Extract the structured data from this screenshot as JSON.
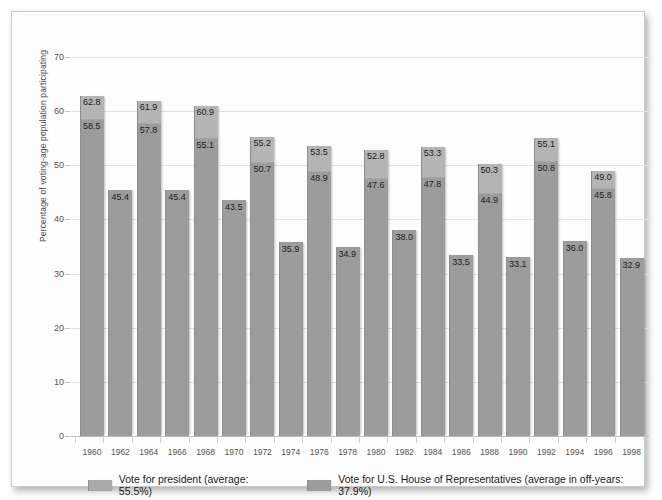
{
  "chart_data": {
    "type": "bar",
    "title": "",
    "xlabel": "",
    "ylabel": "Percentage of voting-age population participating",
    "ylim": [
      0,
      70
    ],
    "yticks": [
      0,
      10,
      20,
      30,
      40,
      50,
      60,
      70
    ],
    "grid": true,
    "legend_position": "bottom",
    "categories": [
      "1960",
      "1962",
      "1964",
      "1966",
      "1968",
      "1970",
      "1972",
      "1974",
      "1976",
      "1978",
      "1980",
      "1982",
      "1984",
      "1986",
      "1988",
      "1990",
      "1992",
      "1994",
      "1996",
      "1998"
    ],
    "series": [
      {
        "name": "Vote for president (average: 55.5%)",
        "values": [
          62.8,
          null,
          61.9,
          null,
          60.9,
          null,
          55.2,
          null,
          53.5,
          null,
          52.8,
          null,
          53.3,
          null,
          50.3,
          null,
          55.1,
          null,
          49.0,
          null
        ]
      },
      {
        "name": "Vote for U.S. House of Representatives (average in off-years: 37.9%)",
        "values": [
          58.5,
          45.4,
          57.8,
          45.4,
          55.1,
          43.5,
          50.7,
          35.9,
          48.9,
          34.9,
          47.6,
          38.0,
          47.8,
          33.5,
          44.9,
          33.1,
          50.8,
          36.0,
          45.8,
          32.9
        ]
      }
    ],
    "bar_labels": [
      {
        "year": "1960",
        "president": "62.8",
        "house": "58.5"
      },
      {
        "year": "1962",
        "president": null,
        "house": "45.4"
      },
      {
        "year": "1964",
        "president": "61.9",
        "house": "57.8"
      },
      {
        "year": "1966",
        "president": null,
        "house": "45.4"
      },
      {
        "year": "1968",
        "president": "60.9",
        "house": "55.1"
      },
      {
        "year": "1970",
        "president": null,
        "house": "43.5"
      },
      {
        "year": "1972",
        "president": "55.2",
        "house": "50.7"
      },
      {
        "year": "1974",
        "president": null,
        "house": "35.9"
      },
      {
        "year": "1976",
        "president": "53.5",
        "house": "48.9"
      },
      {
        "year": "1978",
        "president": null,
        "house": "34.9"
      },
      {
        "year": "1980",
        "president": "52.8",
        "house": "47.6"
      },
      {
        "year": "1982",
        "president": null,
        "house": "38.0"
      },
      {
        "year": "1984",
        "president": "53.3",
        "house": "47.8"
      },
      {
        "year": "1986",
        "president": null,
        "house": "33.5"
      },
      {
        "year": "1988",
        "president": "50.3",
        "house": "44.9"
      },
      {
        "year": "1990",
        "president": null,
        "house": "33.1"
      },
      {
        "year": "1992",
        "president": "55.1",
        "house": "50.8"
      },
      {
        "year": "1994",
        "president": null,
        "house": "36.0"
      },
      {
        "year": "1996",
        "president": "49.0",
        "house": "45.8"
      },
      {
        "year": "1998",
        "president": null,
        "house": "32.9"
      }
    ],
    "colors": {
      "bar_main": "#9c9c9c",
      "bar_light": "#b4b4b4",
      "grid": "#e2e2e2",
      "axis": "#bdbdbd",
      "text": "#1c1c1c"
    }
  },
  "legend": {
    "items": [
      {
        "label": "Vote for president (average: 55.5%)",
        "swatch": "light"
      },
      {
        "label": "Vote for U.S. House of Representatives (average in off-years: 37.9%)",
        "swatch": "main"
      }
    ]
  }
}
